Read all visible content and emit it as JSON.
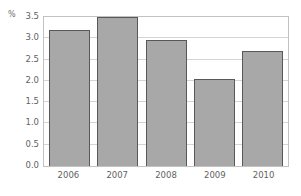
{
  "chart_data": {
    "type": "bar",
    "title": "",
    "subtitle": "",
    "xlabel": "",
    "ylabel": "%",
    "unit_label": "%",
    "categories": [
      "2006",
      "2007",
      "2008",
      "2009",
      "2010"
    ],
    "values": [
      3.2,
      3.5,
      2.95,
      2.05,
      2.7
    ],
    "series": [
      {
        "name": "",
        "values": [
          3.2,
          3.5,
          2.95,
          2.05,
          2.7
        ]
      }
    ],
    "ylim": [
      0.0,
      3.5
    ],
    "ytick_labels": [
      "3.5",
      "3.0",
      "2.5",
      "2.0",
      "1.5",
      "1.0",
      "0.5",
      "0.0"
    ],
    "ytick_values": [
      3.5,
      3.0,
      2.5,
      2.0,
      1.5,
      1.0,
      0.5,
      0.0
    ],
    "xtick_labels": [
      "2006",
      "2007",
      "2008",
      "2009",
      "2010"
    ],
    "grid": true,
    "grid_axis": "y",
    "legend": false,
    "legend_position": "none",
    "annotations": [],
    "colors": {
      "bar_fill": "#a8a8a8",
      "bar_border": "#585858",
      "gridline": "#d4d4d4",
      "frame": "#c2c2c2",
      "tick_text": "#5f5f5f",
      "unit_text": "#6d6d6d",
      "background": "#ffffff"
    }
  }
}
